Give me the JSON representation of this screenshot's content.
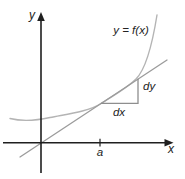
{
  "diagram": {
    "labels": {
      "y_axis": "y",
      "x_axis": "x",
      "curve_equation": "y = f(x)",
      "rise": "dy",
      "run": "dx",
      "x_tick": "a"
    },
    "colors": {
      "background": "#ffffff",
      "axis": "#1f1f1f",
      "curve": "#b4b4b4",
      "tangent_line": "#9b9b9b",
      "triangle": "#8e8e8e",
      "label_text": "#232323"
    }
  }
}
